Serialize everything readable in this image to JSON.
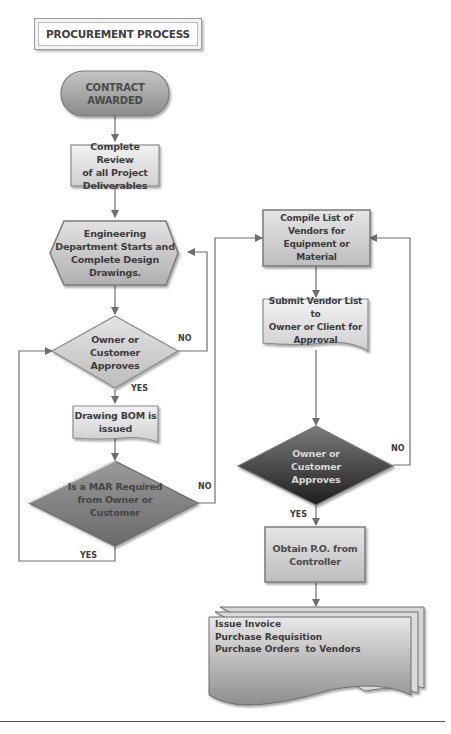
{
  "title": "PROCUREMENT PROCESS",
  "colors": {
    "terminator": "#9e9e9e",
    "process_light": "#dcdcdc",
    "decision_light": "#cfcfcf",
    "decision_mid": "#7d7d7d",
    "decision_dark": "#3a3a3a",
    "connector": "#6e6e6e",
    "text": "#3c3c3c",
    "text_inverse": "#e0e0e0"
  },
  "nodes": {
    "contract_awarded": {
      "lines": [
        "CONTRACT",
        "AWARDED"
      ],
      "shape": "terminator"
    },
    "complete_review": {
      "lines": [
        "Complete Review",
        "of all Project",
        "Deliverables"
      ],
      "shape": "process"
    },
    "engineering": {
      "lines": [
        "Engineering",
        "Department Starts and",
        "Complete Design",
        "Drawings."
      ],
      "shape": "preparation"
    },
    "owner_approves_1": {
      "lines": [
        "Owner or",
        "Customer",
        "Approves"
      ],
      "shape": "decision"
    },
    "drawing_bom": {
      "lines": [
        "Drawing BOM is",
        "issued"
      ],
      "shape": "document"
    },
    "mar_required": {
      "lines": [
        "Is a MAR Required",
        "from Owner or",
        "Customer"
      ],
      "shape": "decision"
    },
    "compile_list": {
      "lines": [
        "Compile List of",
        "Vendors for",
        "Equipment or Material"
      ],
      "shape": "process"
    },
    "submit_vendor": {
      "lines": [
        "Submit Vendor List to",
        "Owner or Client for",
        "Approval"
      ],
      "shape": "document"
    },
    "owner_approves_2": {
      "lines": [
        "Owner or",
        "Customer",
        "Approves"
      ],
      "shape": "decision"
    },
    "obtain_po": {
      "lines": [
        "Obtain P.O. from",
        "Controller"
      ],
      "shape": "process"
    },
    "outputs": {
      "lines": [
        "Issue Invoice",
        "Purchase Requisition",
        "Purchase Orders  to Vendors"
      ],
      "shape": "multi-document"
    }
  },
  "edge_labels": {
    "owner1_no": "NO",
    "owner1_yes": "YES",
    "mar_no": "NO",
    "mar_yes": "YES",
    "owner2_no": "NO",
    "owner2_yes": "YES"
  }
}
